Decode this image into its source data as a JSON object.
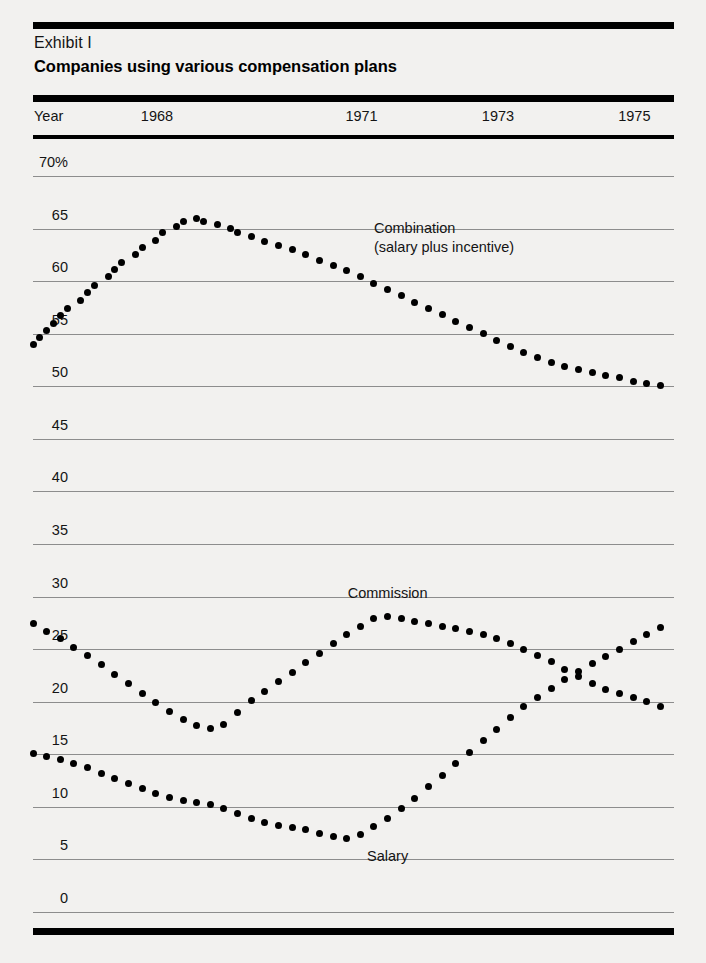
{
  "exhibit": {
    "number": "Exhibit I",
    "title": "Companies using various compensation plans"
  },
  "axis": {
    "year_axis_name": "Year",
    "year_ticks": [
      "1968",
      "1971",
      "1973",
      "1975",
      "1977"
    ],
    "y_ticks": [
      "70%",
      "65",
      "60",
      "55",
      "50",
      "45",
      "40",
      "35",
      "30",
      "25",
      "20",
      "15",
      "10",
      "5",
      "0"
    ]
  },
  "series_labels": {
    "combination_line1": "Combination",
    "combination_line2": "(salary plus incentive)",
    "commission": "Commission",
    "salary": "Salary"
  },
  "colors": {
    "rule": "#000000",
    "gridline": "#8d8d8d",
    "marker": "#000000",
    "text": "#141414",
    "page_background": "#f2f1ef"
  },
  "chart_data": {
    "type": "scatter",
    "title": "Companies using various compensation plans",
    "subtitle": "Exhibit I",
    "xlabel": "Year",
    "ylabel": "",
    "grid": true,
    "legend": "inline-annotations",
    "xlim": [
      1968,
      1977.4
    ],
    "ylim": [
      0,
      70
    ],
    "ytick_values": [
      70,
      65,
      60,
      55,
      50,
      45,
      40,
      35,
      30,
      25,
      20,
      15,
      10,
      5,
      0
    ],
    "xtick_values": [
      1968,
      1971,
      1973,
      1975,
      1977
    ],
    "units": "percent of companies",
    "series": [
      {
        "name": "Combination (salary plus incentive)",
        "x": [
          1968.0,
          1968.1,
          1968.2,
          1968.3,
          1968.4,
          1968.5,
          1968.7,
          1968.8,
          1968.9,
          1969.1,
          1969.2,
          1969.3,
          1969.5,
          1969.6,
          1969.8,
          1969.9,
          1970.1,
          1970.2,
          1970.4,
          1970.5,
          1970.7,
          1970.9,
          1971.0,
          1971.2,
          1971.4,
          1971.6,
          1971.8,
          1972.0,
          1972.2,
          1972.4,
          1972.6,
          1972.8,
          1973.0,
          1973.2,
          1973.4,
          1973.6,
          1973.8,
          1974.0,
          1974.2,
          1974.4,
          1974.6,
          1974.8,
          1975.0,
          1975.2,
          1975.4,
          1975.6,
          1975.8,
          1976.0,
          1976.2,
          1976.4,
          1976.6,
          1976.8,
          1977.0,
          1977.2
        ],
        "y": [
          54.0,
          54.6,
          55.3,
          56.0,
          56.7,
          57.4,
          58.2,
          58.9,
          59.6,
          60.4,
          61.1,
          61.8,
          62.5,
          63.2,
          63.9,
          64.6,
          65.2,
          65.7,
          66.0,
          65.7,
          65.4,
          65.0,
          64.6,
          64.2,
          63.8,
          63.4,
          63.0,
          62.5,
          62.0,
          61.5,
          61.0,
          60.4,
          59.8,
          59.2,
          58.6,
          58.0,
          57.4,
          56.8,
          56.2,
          55.6,
          55.0,
          54.4,
          53.8,
          53.2,
          52.7,
          52.3,
          51.9,
          51.6,
          51.3,
          51.0,
          50.8,
          50.5,
          50.3,
          50.1
        ]
      },
      {
        "name": "Commission",
        "x": [
          1968.0,
          1968.2,
          1968.4,
          1968.6,
          1968.8,
          1969.0,
          1969.2,
          1969.4,
          1969.6,
          1969.8,
          1970.0,
          1970.2,
          1970.4,
          1970.6,
          1970.8,
          1971.0,
          1971.2,
          1971.4,
          1971.6,
          1971.8,
          1972.0,
          1972.2,
          1972.4,
          1972.6,
          1972.8,
          1973.0,
          1973.2,
          1973.4,
          1973.6,
          1973.8,
          1974.0,
          1974.2,
          1974.4,
          1974.6,
          1974.8,
          1975.0,
          1975.2,
          1975.4,
          1975.6,
          1975.8,
          1976.0,
          1976.2,
          1976.4,
          1976.6,
          1976.8,
          1977.0,
          1977.2
        ],
        "y": [
          27.4,
          26.7,
          26.0,
          25.2,
          24.4,
          23.5,
          22.6,
          21.7,
          20.8,
          19.9,
          19.1,
          18.3,
          17.7,
          17.5,
          17.8,
          19.0,
          20.1,
          21.0,
          21.9,
          22.8,
          23.7,
          24.6,
          25.5,
          26.4,
          27.2,
          27.9,
          28.1,
          27.9,
          27.6,
          27.4,
          27.2,
          27.0,
          26.7,
          26.4,
          26.0,
          25.5,
          25.0,
          24.4,
          23.8,
          23.1,
          22.4,
          21.7,
          21.2,
          20.8,
          20.4,
          20.0,
          19.5
        ]
      },
      {
        "name": "Salary",
        "x": [
          1968.0,
          1968.2,
          1968.4,
          1968.6,
          1968.8,
          1969.0,
          1969.2,
          1969.4,
          1969.6,
          1969.8,
          1970.0,
          1970.2,
          1970.4,
          1970.6,
          1970.8,
          1971.0,
          1971.2,
          1971.4,
          1971.6,
          1971.8,
          1972.0,
          1972.2,
          1972.4,
          1972.6,
          1972.8,
          1973.0,
          1973.2,
          1973.4,
          1973.6,
          1973.8,
          1974.0,
          1974.2,
          1974.4,
          1974.6,
          1974.8,
          1975.0,
          1975.2,
          1975.4,
          1975.6,
          1975.8,
          1976.0,
          1976.2,
          1976.4,
          1976.6,
          1976.8,
          1977.0,
          1977.2
        ],
        "y": [
          15.1,
          14.8,
          14.5,
          14.1,
          13.7,
          13.2,
          12.7,
          12.2,
          11.7,
          11.3,
          10.9,
          10.6,
          10.4,
          10.2,
          9.8,
          9.4,
          8.9,
          8.5,
          8.2,
          8.0,
          7.8,
          7.5,
          7.2,
          7.0,
          7.4,
          8.1,
          8.9,
          9.8,
          10.8,
          11.9,
          13.0,
          14.1,
          15.2,
          16.3,
          17.4,
          18.5,
          19.5,
          20.4,
          21.3,
          22.1,
          22.9,
          23.6,
          24.3,
          25.0,
          25.7,
          26.4,
          27.1
        ]
      }
    ],
    "annotations": [
      {
        "text": "Combination\n(salary plus incentive)",
        "x": 1973.0,
        "y": 65.0
      },
      {
        "text": "Commission",
        "x": 1973.2,
        "y": 30.2
      },
      {
        "text": "Salary",
        "x": 1973.2,
        "y": 5.2
      }
    ]
  }
}
